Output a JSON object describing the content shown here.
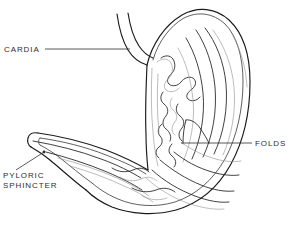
{
  "figure": {
    "style": "black-and-white line art, cutaway showing interior mucosal folds",
    "background_color": "#ffffff",
    "line_color": "#1a1a1a",
    "label_color": "#2e2e2e",
    "width": 294,
    "height": 225
  },
  "labels": [
    {
      "id": "cardia",
      "text": "CARDIA",
      "position": {
        "x": 4,
        "y": 45
      },
      "leader": {
        "from": {
          "x": 45,
          "y": 49
        },
        "to": {
          "x": 130,
          "y": 49
        }
      },
      "anchor_side": "left"
    },
    {
      "id": "folds",
      "text": "FOLDS",
      "position": {
        "x": 255,
        "y": 139
      },
      "leader": {
        "from": {
          "x": 252,
          "y": 143
        },
        "to": {
          "x": 181,
          "y": 143
        }
      },
      "anchor_side": "right"
    },
    {
      "id": "pyloric-sphincter",
      "text": "PYLORIC\nSPHINCTER",
      "line1": "PYLORIC",
      "line2": "SPHINCTER",
      "position": {
        "x": 3,
        "y": 171
      },
      "leader": {
        "from": {
          "x": 16,
          "y": 170
        },
        "to": {
          "x": 44,
          "y": 152
        }
      },
      "anchor_side": "left",
      "has_dot": true,
      "dot": {
        "x": 44,
        "y": 152,
        "r": 1.4
      }
    }
  ],
  "anatomy_parts": [
    {
      "id": "esophagus",
      "name": "esophagus"
    },
    {
      "id": "fundus",
      "name": "fundus"
    },
    {
      "id": "body",
      "name": "body of stomach"
    },
    {
      "id": "greater-curvature",
      "name": "greater curvature"
    },
    {
      "id": "lesser-curvature",
      "name": "lesser curvature"
    },
    {
      "id": "rugae",
      "name": "rugae (mucosal folds)"
    },
    {
      "id": "pylorus",
      "name": "pylorus"
    },
    {
      "id": "duodenum",
      "name": "duodenum"
    }
  ]
}
